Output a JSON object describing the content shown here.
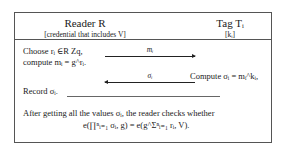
{
  "header": {
    "reader_title": "Reader R",
    "reader_subtitle": "[credential that includes V]",
    "tag_title": "Tag Tᵢ",
    "tag_subtitle": "[kᵢ]"
  },
  "steps": {
    "reader_line1": "Choose rᵢ ∈R Zq,",
    "reader_line2": "compute mᵢ = g^rᵢ.",
    "msg1_label": "mᵢ",
    "msg2_label": "σᵢ",
    "tag_compute": "Compute σᵢ = mᵢ^kᵢ,",
    "reader_record": "Record σᵢ."
  },
  "footer": {
    "line1": "After getting all the values σᵢ, the reader checks whether",
    "line2": "e(∏ⁿᵢ₌₁ σᵢ, g) = e(g^Σⁿᵢ₌₁ rᵢ, V)."
  }
}
